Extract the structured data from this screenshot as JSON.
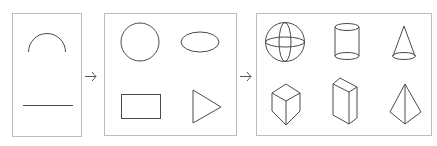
{
  "diagram": {
    "type": "progression",
    "colors": {
      "box_border": "#bdbdbd",
      "stroke": "#4a4a4a",
      "background": "#ffffff"
    },
    "stages": [
      {
        "id": "stage-1d",
        "label": "1D",
        "shapes": [
          "arc",
          "line"
        ]
      },
      {
        "id": "stage-2d",
        "label": "2D",
        "shapes": [
          "circle",
          "ellipse",
          "rectangle",
          "triangle"
        ]
      },
      {
        "id": "stage-3d",
        "label": "3D",
        "shapes": [
          "sphere",
          "cylinder",
          "cone",
          "cube",
          "rectangular-prism",
          "pyramid"
        ]
      }
    ],
    "connectors": [
      {
        "from": "stage-1d",
        "to": "stage-2d",
        "icon": "arrow-right-icon"
      },
      {
        "from": "stage-2d",
        "to": "stage-3d",
        "icon": "arrow-right-icon"
      }
    ]
  }
}
